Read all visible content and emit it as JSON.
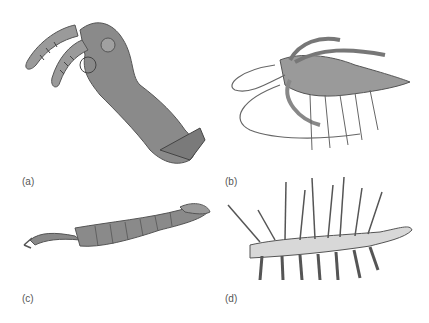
{
  "figure": {
    "panels": [
      {
        "id": "a",
        "label": "(a)",
        "subject": "opabinia-like head with grasping appendages"
      },
      {
        "id": "b",
        "label": "(b)",
        "subject": "marrella-like arthropod with long antennae"
      },
      {
        "id": "c",
        "label": "(c)",
        "subject": "segmented arthropod with frontal proboscis claw"
      },
      {
        "id": "d",
        "label": "(d)",
        "subject": "hallucigenia-like lobopodian with spines and legs"
      }
    ],
    "colors": {
      "body": "#8d8d8d",
      "shade": "#6a6a6a",
      "light": "#b8b8b8",
      "label": "#555555"
    }
  }
}
